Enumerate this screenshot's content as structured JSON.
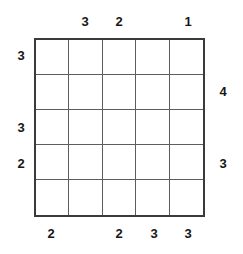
{
  "puzzle": {
    "type": "skyscrapers-grid",
    "size": {
      "rows": 5,
      "columns": 5
    },
    "colors": {
      "background": "#ffffff",
      "border": "#3a3a3a",
      "gridline": "#5d5d5d",
      "clue_text": "#161616"
    },
    "clues": {
      "top": [
        "",
        "3",
        "2",
        "",
        "1"
      ],
      "bottom": [
        "2",
        "",
        "2",
        "3",
        "3"
      ],
      "left": [
        "3",
        "",
        "3",
        "2",
        ""
      ],
      "right": [
        "",
        "4",
        "",
        "3",
        ""
      ]
    },
    "cells": [
      [
        "",
        "",
        "",
        "",
        ""
      ],
      [
        "",
        "",
        "",
        "",
        ""
      ],
      [
        "",
        "",
        "",
        "",
        ""
      ],
      [
        "",
        "",
        "",
        "",
        ""
      ],
      [
        "",
        "",
        "",
        "",
        ""
      ]
    ]
  }
}
